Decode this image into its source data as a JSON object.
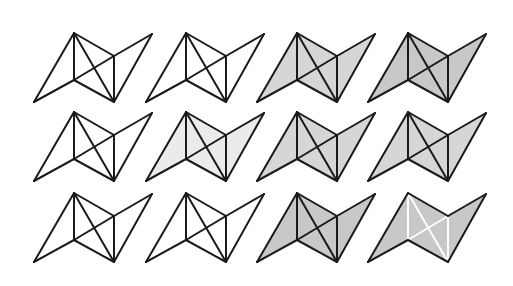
{
  "diagram": {
    "shape": {
      "vertices": {
        "A": [
          0,
          0
        ],
        "B": [
          -40,
          69
        ],
        "C": [
          0,
          47
        ],
        "D": [
          40,
          69
        ],
        "E": [
          40,
          23
        ],
        "F": [
          78,
          1
        ]
      },
      "outline": [
        "A",
        "B",
        "C",
        "D",
        "F",
        "E"
      ],
      "edges": [
        [
          "A",
          "B"
        ],
        [
          "B",
          "C"
        ],
        [
          "A",
          "C"
        ],
        [
          "A",
          "E"
        ],
        [
          "A",
          "D"
        ],
        [
          "C",
          "D"
        ],
        [
          "C",
          "E"
        ],
        [
          "E",
          "D"
        ],
        [
          "E",
          "F"
        ],
        [
          "F",
          "D"
        ]
      ],
      "inner_edges": [
        [
          "A",
          "C"
        ],
        [
          "A",
          "D"
        ],
        [
          "C",
          "E"
        ],
        [
          "E",
          "D"
        ]
      ]
    },
    "colors": {
      "white": "#ffffff",
      "light": "#ebebeb",
      "medium": "#d6d6d6",
      "dark": "#c8c8c8",
      "stroke": "#1a1a1a",
      "inner_white_stroke": "#ffffff"
    },
    "figures": [
      {
        "row": 0,
        "col": 0,
        "x": 74,
        "y": 33,
        "fill": "white",
        "inner": "black"
      },
      {
        "row": 0,
        "col": 1,
        "x": 186,
        "y": 33,
        "fill": "white",
        "inner": "black"
      },
      {
        "row": 0,
        "col": 2,
        "x": 297,
        "y": 33,
        "fill": "medium",
        "inner": "black"
      },
      {
        "row": 0,
        "col": 3,
        "x": 408,
        "y": 33,
        "fill": "dark",
        "inner": "black"
      },
      {
        "row": 1,
        "col": 0,
        "x": 74,
        "y": 112,
        "fill": "white",
        "inner": "black"
      },
      {
        "row": 1,
        "col": 1,
        "x": 186,
        "y": 112,
        "fill": "light",
        "inner": "black"
      },
      {
        "row": 1,
        "col": 2,
        "x": 297,
        "y": 112,
        "fill": "medium",
        "inner": "black"
      },
      {
        "row": 1,
        "col": 3,
        "x": 408,
        "y": 112,
        "fill": "medium",
        "inner": "black"
      },
      {
        "row": 2,
        "col": 0,
        "x": 74,
        "y": 193,
        "fill": "white",
        "inner": "black"
      },
      {
        "row": 2,
        "col": 1,
        "x": 186,
        "y": 193,
        "fill": "white",
        "inner": "black"
      },
      {
        "row": 2,
        "col": 2,
        "x": 297,
        "y": 193,
        "fill": "dark",
        "inner": "black"
      },
      {
        "row": 2,
        "col": 3,
        "x": 408,
        "y": 193,
        "fill": "dark",
        "inner": "white"
      }
    ]
  }
}
